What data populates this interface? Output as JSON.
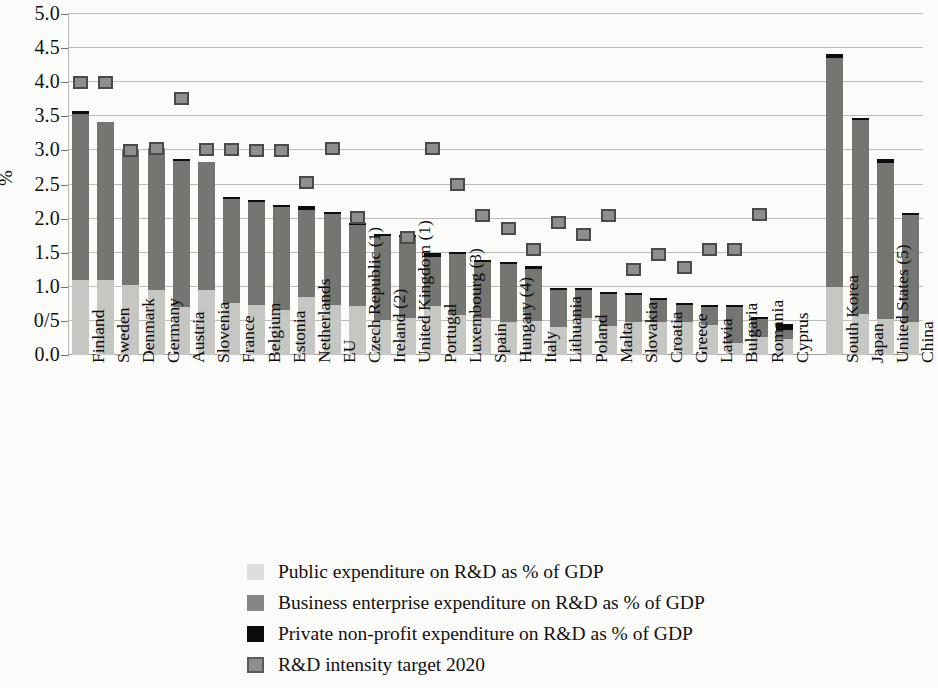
{
  "chart_data": {
    "type": "bar",
    "subtype": "stacked-bar-with-target-markers",
    "title": "",
    "xlabel": "",
    "ylabel": "%",
    "ylim": [
      0.0,
      5.0
    ],
    "ytick_values": [
      0.0,
      0.5,
      1.0,
      1.5,
      2.0,
      2.5,
      3.0,
      3.5,
      4.0,
      4.5,
      5.0
    ],
    "ytick_labels": [
      "0.0",
      "0/5",
      "1.0",
      "1.5",
      "2.0",
      "2.5",
      "3.0",
      "3.5",
      "4.0",
      "4.5",
      "5.0"
    ],
    "grid": true,
    "grid_axis": "y",
    "legend_position": "bottom",
    "categories": [
      "Finland",
      "Sweden",
      "Denmark",
      "Germany",
      "Austria",
      "Slovenia",
      "France",
      "Belgium",
      "Estonia",
      "Netherlands",
      "EU",
      "Czech Republic (1)",
      "Ireland (2)",
      "United Kingdom (1)",
      "Portugal",
      "Luxembourg (3)",
      "Spain",
      "Hungary (4)",
      "Italy",
      "Lithuania",
      "Poland",
      "Malta",
      "Slovakia",
      "Croatia",
      "Greece",
      "Latvia",
      "Bulgaria",
      "Romania",
      "Cyprus",
      "",
      "South Korea",
      "Japan",
      "United States (5)",
      "China"
    ],
    "series": [
      {
        "name": "Public expenditure on R&D as % of GDP",
        "key": "public",
        "color": "#c6c6c2",
        "values": [
          1.1,
          1.1,
          1.02,
          0.96,
          0.7,
          0.95,
          0.77,
          0.73,
          0.66,
          0.85,
          0.74,
          0.72,
          0.52,
          0.55,
          0.72,
          0.58,
          0.55,
          0.48,
          0.5,
          0.41,
          0.54,
          0.43,
          0.48,
          0.48,
          0.49,
          0.44,
          0.18,
          0.26,
          0.24,
          0,
          1.0,
          0.6,
          0.53,
          0.48
        ]
      },
      {
        "name": "Business enterprise expenditure on R&D as % of GDP",
        "key": "business",
        "color": "#757572",
        "values": [
          2.43,
          2.32,
          1.99,
          2.08,
          2.15,
          1.88,
          1.52,
          1.51,
          1.51,
          1.28,
          1.33,
          1.19,
          1.23,
          1.18,
          0.72,
          0.9,
          0.82,
          0.85,
          0.76,
          0.54,
          0.42,
          0.46,
          0.4,
          0.32,
          0.25,
          0.26,
          0.52,
          0.27,
          0.13,
          0,
          3.36,
          2.85,
          2.28,
          1.58
        ]
      },
      {
        "name": "Private non-profit expenditure on R&D as % of GDP",
        "key": "private",
        "color": "#0d0d0d",
        "values": [
          0.05,
          0.0,
          0.0,
          0.0,
          0.02,
          0.0,
          0.02,
          0.02,
          0.02,
          0.05,
          0.02,
          0.01,
          0.01,
          0.02,
          0.06,
          0.02,
          0.02,
          0.01,
          0.04,
          0.01,
          0.01,
          0.01,
          0.01,
          0.01,
          0.02,
          0.01,
          0.01,
          0.01,
          0.08,
          0,
          0.06,
          0.03,
          0.07,
          0.02
        ]
      }
    ],
    "target_series": {
      "name": "R&D intensity target 2020",
      "key": "target",
      "color": "#8e8e8b",
      "values": [
        4.0,
        4.0,
        3.0,
        3.03,
        3.76,
        3.02,
        3.02,
        3.0,
        3.0,
        2.53,
        3.03,
        2.02,
        null,
        1.73,
        3.03,
        2.5,
        2.05,
        1.85,
        1.55,
        1.95,
        1.76,
        2.05,
        1.26,
        1.47,
        1.28,
        1.55,
        1.55,
        2.06,
        null,
        null,
        null,
        null,
        null,
        null
      ]
    },
    "totals": [
      3.58,
      3.42,
      3.01,
      3.04,
      2.87,
      2.83,
      2.31,
      2.26,
      2.19,
      2.18,
      2.09,
      1.92,
      1.76,
      1.75,
      1.5,
      1.5,
      1.39,
      1.34,
      1.3,
      0.96,
      0.97,
      0.9,
      0.89,
      0.81,
      0.76,
      0.71,
      0.71,
      0.54,
      0.45,
      null,
      4.42,
      3.48,
      2.88,
      2.08
    ]
  },
  "axis": {
    "y_title": "%"
  },
  "legend": {
    "items": [
      {
        "label": "Public expenditure on R&D as % of GDP",
        "swatch": "public-swatch"
      },
      {
        "label": "Business enterprise expenditure on R&D as % of GDP",
        "swatch": "business-swatch"
      },
      {
        "label": "Private non-profit expenditure on R&D as % of GDP",
        "swatch": "private-swatch"
      },
      {
        "label": "R&D intensity target 2020",
        "swatch": "target-swatch"
      }
    ]
  }
}
